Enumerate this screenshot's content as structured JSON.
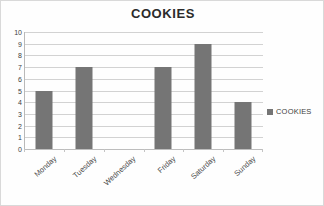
{
  "chart_data": {
    "type": "bar",
    "title": "COOKIES",
    "xlabel": "",
    "ylabel": "",
    "categories": [
      "Monday",
      "Tuesday",
      "Wednesday",
      "Friday",
      "Saturday",
      "Sunday"
    ],
    "values": [
      5,
      7,
      0,
      7,
      9,
      4
    ],
    "series": [
      {
        "name": "COOKIES",
        "values": [
          5,
          7,
          0,
          7,
          9,
          4
        ]
      }
    ],
    "ylim": [
      0,
      10
    ],
    "ytick_step": 1,
    "ytick_labels": [
      "10",
      "9",
      "8",
      "7",
      "6",
      "5",
      "4",
      "3",
      "2",
      "1",
      "0"
    ],
    "grid": true,
    "legend_position": "right",
    "legend_entries": [
      "COOKIES"
    ],
    "bar_color": "#757575",
    "gridline_color": "#d2d2d2",
    "background_color": "#fefefe",
    "border_color": "#d9d9d9"
  }
}
